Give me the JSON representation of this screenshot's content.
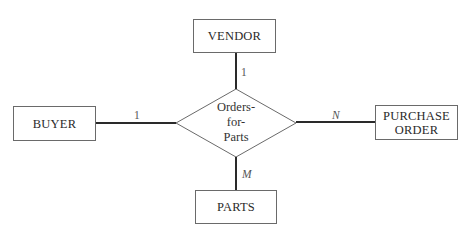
{
  "diagram": {
    "type": "entity-relationship",
    "relationship": {
      "name": "Orders-for-Parts",
      "lines": [
        "Orders-",
        "for-",
        "Parts"
      ]
    },
    "entities": {
      "vendor": {
        "label": "VENDOR",
        "cardinality": "1"
      },
      "buyer": {
        "label": "BUYER",
        "cardinality": "1"
      },
      "purchase_order": {
        "label_line1": "PURCHASE",
        "label_line2": "ORDER",
        "cardinality": "N"
      },
      "parts": {
        "label": "PARTS",
        "cardinality": "M"
      }
    },
    "colors": {
      "background": "#ffffff",
      "box_border": "#6a6a6a",
      "connector": "#2a2a2a",
      "text": "#2a2a2a"
    }
  }
}
